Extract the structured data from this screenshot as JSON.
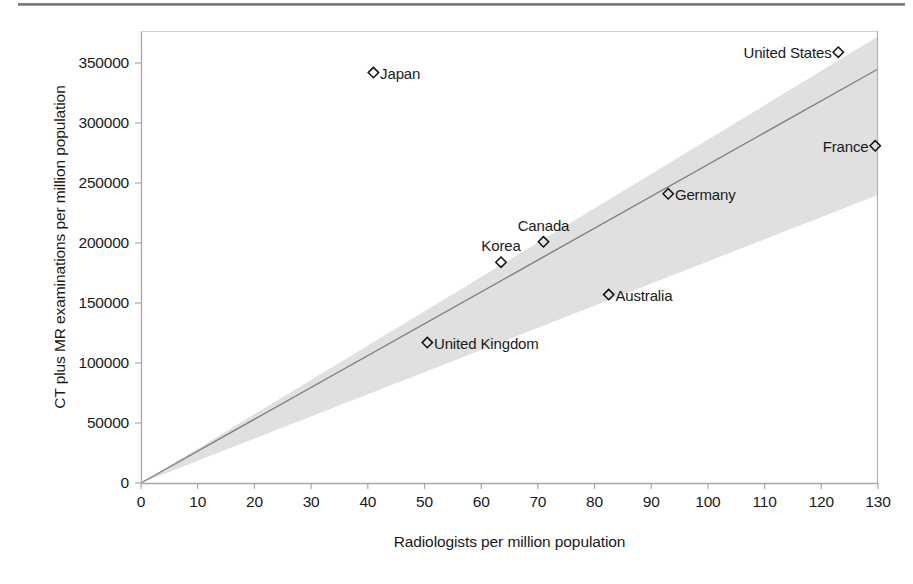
{
  "figure": {
    "top_rule": "horizontal-rule"
  },
  "chart_data": {
    "type": "scatter",
    "title": "",
    "xlabel": "Radiologists per million population",
    "ylabel": "CT plus MR examinations per million population",
    "xlim": [
      0,
      130
    ],
    "ylim": [
      0,
      362000
    ],
    "xticks": [
      "0",
      "10",
      "20",
      "30",
      "40",
      "50",
      "60",
      "70",
      "80",
      "90",
      "100",
      "110",
      "120",
      "130"
    ],
    "xtick_values": [
      0,
      10,
      20,
      30,
      40,
      50,
      60,
      70,
      80,
      90,
      100,
      110,
      120,
      130
    ],
    "yticks": [
      "0",
      "50000",
      "100000",
      "150000",
      "200000",
      "250000",
      "300000",
      "350000"
    ],
    "ytick_values": [
      0,
      50000,
      100000,
      150000,
      200000,
      250000,
      300000,
      350000
    ],
    "grid": false,
    "legend": "none",
    "marker": "open-diamond",
    "points": [
      {
        "label": "Japan",
        "x": 41.0,
        "y": 342000,
        "label_pos": "right"
      },
      {
        "label": "United States",
        "x": 123.0,
        "y": 359000,
        "label_pos": "left"
      },
      {
        "label": "France",
        "x": 129.5,
        "y": 281000,
        "label_pos": "left"
      },
      {
        "label": "Germany",
        "x": 93.0,
        "y": 241000,
        "label_pos": "right"
      },
      {
        "label": "Canada",
        "x": 71.0,
        "y": 201000,
        "label_pos": "above"
      },
      {
        "label": "Korea",
        "x": 63.5,
        "y": 184000,
        "label_pos": "above"
      },
      {
        "label": "Australia",
        "x": 82.5,
        "y": 157000,
        "label_pos": "right"
      },
      {
        "label": "United Kingdom",
        "x": 50.5,
        "y": 117000,
        "label_pos": "right"
      }
    ],
    "trend_line": {
      "name": "regression-line",
      "x0": 0,
      "y0": 0,
      "x1": 130,
      "y1": 345000,
      "color": "#808080"
    },
    "confidence_band": {
      "name": "confidence-band",
      "color": "#e0e0e0",
      "x0": 0,
      "y0_lower": 0,
      "y0_upper": 0,
      "x1": 130,
      "y1_lower": 240000,
      "y1_upper": 372000
    }
  },
  "colors": {
    "axis": "#9a9a9a",
    "text": "#1a1a1a",
    "band": "#e1e1e1",
    "line": "#7d7d7d",
    "rule": "#6e6e6e"
  }
}
